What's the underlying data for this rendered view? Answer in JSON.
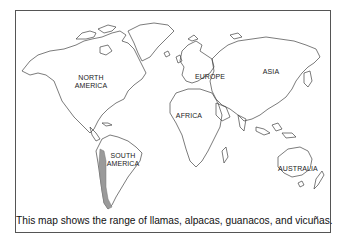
{
  "map": {
    "labels": {
      "north_america": [
        "NORTH",
        "AMERICA"
      ],
      "south_america": [
        "SOUTH",
        "AMERICA"
      ],
      "europe": "EUROPE",
      "asia": "ASIA",
      "africa": "AFRICA",
      "australia": "AUSTRALIA"
    },
    "highlight_region": "Andes range in western South America",
    "highlight_color": "#9a9a9a",
    "outline_color": "#444444"
  },
  "caption": "This map shows the range of llamas, alpacas, guanacos, and vicuñas."
}
